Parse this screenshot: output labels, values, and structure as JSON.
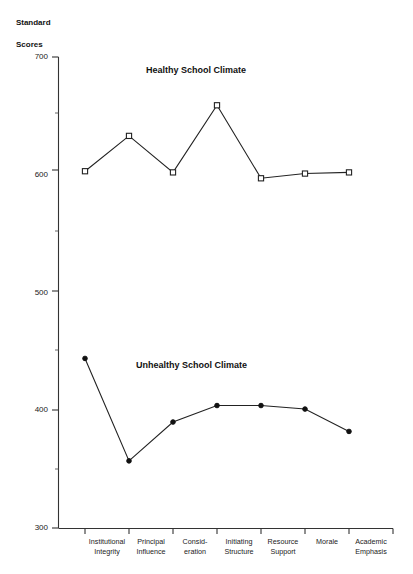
{
  "chart_data": {
    "type": "line",
    "title": "",
    "xlabel": "",
    "ylabel": "Standard Scores",
    "ylabel_line1": "Standard",
    "ylabel_line2": "Scores",
    "ylim": [
      300,
      700
    ],
    "ytick_labels": [
      "700",
      "600",
      "500",
      "400",
      "300"
    ],
    "ytick_values": [
      700,
      600,
      500,
      400,
      300
    ],
    "yminor_values": [
      650,
      550,
      450,
      350
    ],
    "grid": false,
    "legend_position": "inline-annotation",
    "categories": [
      "Institutional\nIntegrity",
      "Principal\nInfluence",
      "Consid-\neration",
      "Initiating\nStructure",
      "Resource\nSupport",
      "Morale",
      "Academic\nEmphasis"
    ],
    "series": [
      {
        "name": "Healthy School Climate",
        "marker": "open-square",
        "values": [
          603,
          633,
          602,
          659,
          597,
          601,
          602
        ]
      },
      {
        "name": "Unhealthy School Climate",
        "marker": "filled-circle",
        "values": [
          444,
          357,
          390,
          404,
          404,
          401,
          382
        ]
      }
    ],
    "annotations": [
      {
        "text": "Healthy School Climate",
        "x_px": 146,
        "y_px": 65
      },
      {
        "text": "Unhealthy School Climate",
        "x_px": 136,
        "y_px": 360
      }
    ],
    "colors": {
      "line": "#222222",
      "axis": "#333333",
      "text": "#111111",
      "background": "#ffffff"
    }
  }
}
